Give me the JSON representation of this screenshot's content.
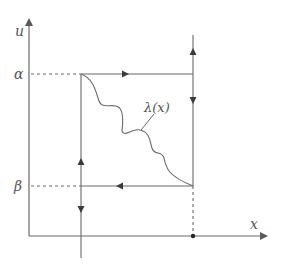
{
  "diagram": {
    "type": "phase-plane",
    "axes": {
      "x_label": "x",
      "y_label": "u"
    },
    "levels": {
      "alpha_label": "α",
      "beta_label": "β"
    },
    "curve_label": "λ(x)",
    "colors": {
      "line": "#6a6a6a",
      "text": "#555555",
      "background": "#ffffff"
    },
    "geometry": {
      "origin": [
        29,
        236
      ],
      "x_axis_end": 273,
      "y_axis_top": 14,
      "alpha_y": 74,
      "beta_y": 186,
      "left_x": 81,
      "right_x": 193,
      "marked_point": [
        193,
        236
      ]
    }
  }
}
